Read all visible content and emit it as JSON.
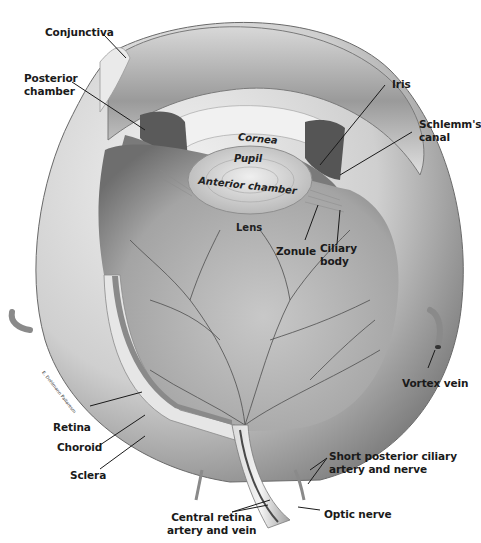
{
  "figure": {
    "style": "grayscale anatomical illustration",
    "colors": {
      "background": "#ffffff",
      "label_text": "#1a1a1a",
      "leader_lines": "#1a1a1a",
      "sclera_light": "#e4e4e4",
      "sclera_shadow": "#8a8a8a",
      "retina_interior": "#a9a9a9",
      "vessels": "#4a4a4a",
      "lens": "#d2d2d2",
      "iris": "#5a5a5a"
    },
    "artist_signature": "E. Dohlmann Pallaresm"
  },
  "labels": {
    "conjunctiva": "Conjunctiva",
    "posterior_chamber_1": "Posterior",
    "posterior_chamber_2": "chamber",
    "cornea": "Cornea",
    "pupil": "Pupil",
    "anterior_chamber": "Anterior chamber",
    "iris": "Iris",
    "schlemms_canal_1": "Schlemm's",
    "schlemms_canal_2": "canal",
    "lens": "Lens",
    "zonule": "Zonule",
    "ciliary_body_1": "Ciliary",
    "ciliary_body_2": "body",
    "vortex_vein": "Vortex vein",
    "retina": "Retina",
    "choroid": "Choroid",
    "sclera": "Sclera",
    "short_posterior_ciliary_1": "Short posterior ciliary",
    "short_posterior_ciliary_2": "artery and nerve",
    "central_retina_1": "Central retina",
    "central_retina_2": "artery and vein",
    "optic_nerve": "Optic nerve"
  }
}
